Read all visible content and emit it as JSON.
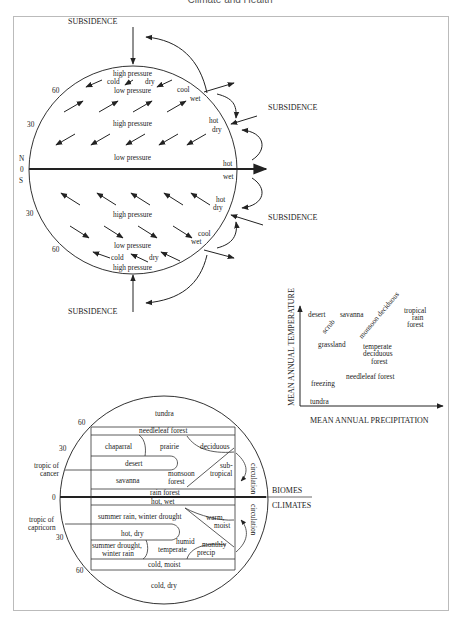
{
  "header": {
    "title": "Climate and Health"
  },
  "circulation_diagram": {
    "subsidence_top": "SUBSIDENCE",
    "subsidence_right_upper": "SUBSIDENCE",
    "subsidence_right_lower": "SUBSIDENCE",
    "subsidence_bottom": "SUBSIDENCE",
    "lat_labels": {
      "n60": "60",
      "n30": "30",
      "N": "N",
      "zero": "0",
      "S": "S",
      "s30": "30",
      "s60": "60"
    },
    "north": {
      "high_pressure_top": "high pressure",
      "cold": "cold",
      "dry": "dry",
      "low_pressure_60": "low pressure",
      "cool": "cool",
      "wet": "wet",
      "high_pressure_30": "high pressure",
      "hot": "hot",
      "dry2": "dry",
      "low_pressure_eq": "low pressure",
      "hot_eq": "hot"
    },
    "south": {
      "wet_eq": "wet",
      "hot": "hot",
      "dry": "dry",
      "high_pressure_30": "high pressure",
      "cool": "cool",
      "wet": "wet",
      "low_pressure_60": "low pressure",
      "cold": "cold",
      "dry2": "dry",
      "high_pressure_bottom": "high pressure"
    }
  },
  "biome_chart": {
    "ylabel": "MEAN ANNUAL TEMPERATURE",
    "xlabel": "MEAN ANNUAL PRECIPITATION",
    "labels": {
      "desert": "desert",
      "scrub": "scrub",
      "savanna": "savanna",
      "monsoon_deciduous": "monsoon deciduous",
      "tropical_1": "tropical",
      "tropical_2": "rain",
      "tropical_3": "forest",
      "grassland": "grassland",
      "temperate_1": "temperate",
      "temperate_2": "deciduous",
      "temperate_3": "forest",
      "needleleaf": "needleleaf forest",
      "freezing": "freezing",
      "tundra": "tundra"
    }
  },
  "biomes_climates": {
    "lat_labels": {
      "n60": "60",
      "n30": "30",
      "zero": "0",
      "s30": "30",
      "s60": "60"
    },
    "tropic_cancer_1": "tropic of",
    "tropic_cancer_2": "cancer",
    "tropic_capricorn_1": "tropic of",
    "tropic_capricorn_2": "capricorn",
    "biomes_label": "BIOMES",
    "climates_label": "CLIMATES",
    "biomes": {
      "tundra": "tundra",
      "needleleaf": "needleleaf forest",
      "chaparral": "chaparral",
      "prairie": "prairie",
      "deciduous": "deciduous",
      "desert": "desert",
      "sub": "sub-",
      "tropical": "tropical",
      "savanna": "savanna",
      "monsoon": "monsoon",
      "forest": "forest",
      "rain_forest": "rain forest",
      "circulation": "circulation"
    },
    "climates": {
      "hot_wet": "hot, wet",
      "summer_rain": "summer rain, winter drought",
      "warm": "warm,",
      "moist": "moist",
      "hot_dry": "hot, dry",
      "humid": "humid",
      "temperate": "temperate",
      "summer_drought": "summer drought,",
      "winter_rain": "winter rain",
      "monthly": "monthly",
      "precip": "precip",
      "cold_moist": "cold, moist",
      "cold_dry": "cold, dry",
      "circulation": "circulation"
    }
  }
}
